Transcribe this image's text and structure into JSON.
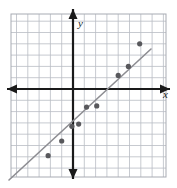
{
  "figure": {
    "name": "scatter-plot-with-trend-line",
    "width": 177,
    "height": 188,
    "background": "#ffffff"
  },
  "axes": {
    "x_label": "x",
    "y_label": "y",
    "axis_color": "#1a1a1a",
    "origin_px": {
      "x": 73,
      "y": 89
    },
    "x_axis_y_px": 89,
    "y_axis_x_px": 73,
    "arrowheads": [
      "left",
      "right",
      "up",
      "down"
    ]
  },
  "grid": {
    "color": "#b9bcc4",
    "border_color": "#a8abb3",
    "cell_size_px": 11.3,
    "left_px": 11,
    "top_px": 14,
    "right_px": 166,
    "bottom_px": 177,
    "visible": true
  },
  "chart_data": {
    "type": "scatter",
    "title": "",
    "xlabel": "x",
    "ylabel": "y",
    "grid": true,
    "legend": false,
    "xlim": [
      -5.5,
      8.2
    ],
    "ylim": [
      -6.6,
      6.6
    ],
    "point_color": "#58585c",
    "point_radius_px": 2.6,
    "points": [
      {
        "x": -2.2,
        "y": -5.9
      },
      {
        "x": -1.0,
        "y": -4.6
      },
      {
        "x": -0.1,
        "y": -3.3
      },
      {
        "x": 0.5,
        "y": -3.1
      },
      {
        "x": 1.2,
        "y": -1.6
      },
      {
        "x": 2.1,
        "y": -1.5
      },
      {
        "x": 4.0,
        "y": 1.2
      },
      {
        "x": 4.9,
        "y": 2.0
      },
      {
        "x": 5.9,
        "y": 4.0
      }
    ],
    "trend_line": {
      "name": "line-of-best-fit",
      "color": "#8d8d92",
      "width_px": 1.6,
      "start_px": {
        "x": 9,
        "y": 180
      },
      "end_px": {
        "x": 151,
        "y": 49
      },
      "slope_approx": 1.0,
      "intercept_approx": -3.0
    },
    "annotations": [
      {
        "label": "outlier-point",
        "x": 5.9,
        "y": 4.0
      }
    ]
  }
}
